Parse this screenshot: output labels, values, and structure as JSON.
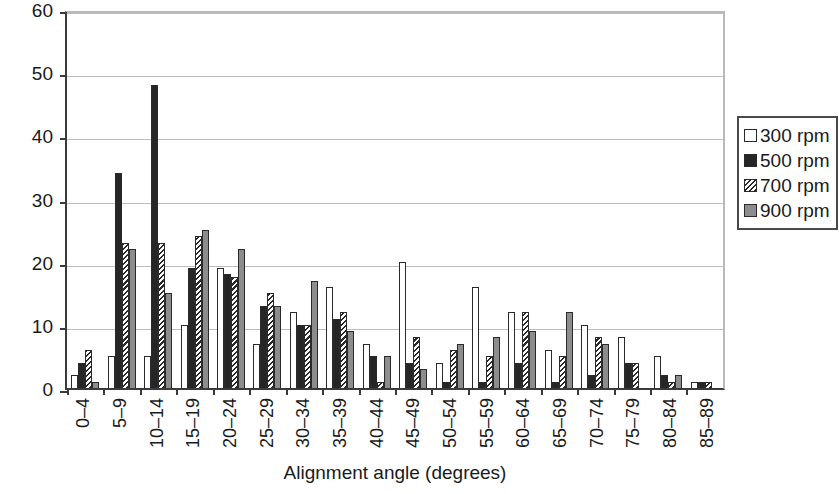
{
  "chart_data": {
    "type": "bar",
    "title": "",
    "xlabel": "Alignment angle (degrees)",
    "ylabel": "Number of fibres",
    "ylim": [
      0,
      60
    ],
    "yticks": [
      0,
      10,
      20,
      30,
      40,
      50,
      60
    ],
    "grid": true,
    "legend_position": "right",
    "categories": [
      "0–4",
      "5–9",
      "10–14",
      "15–19",
      "20–24",
      "25–29",
      "30–34",
      "35–39",
      "40–44",
      "45–49",
      "50–54",
      "55–59",
      "60–64",
      "65–69",
      "70–74",
      "75–79",
      "80–84",
      "85–89"
    ],
    "series": [
      {
        "name": "300 rpm",
        "color": "#ffffff",
        "fill": "white",
        "values": [
          2,
          5,
          5,
          10,
          19,
          7,
          12,
          16,
          7,
          20,
          4,
          16,
          12,
          6,
          10,
          8,
          5,
          1
        ]
      },
      {
        "name": "500 rpm",
        "color": "#262626",
        "fill": "black",
        "values": [
          4,
          34,
          48,
          19,
          18,
          13,
          10,
          11,
          5,
          4,
          1,
          1,
          4,
          1,
          2,
          4,
          2,
          1
        ]
      },
      {
        "name": "700 rpm",
        "color": "#2b2b2b",
        "fill": "hatched",
        "values": [
          6,
          23,
          23,
          24,
          17.5,
          15,
          10,
          12,
          1,
          8,
          6,
          5,
          12,
          5,
          8,
          4,
          1,
          1
        ]
      },
      {
        "name": "900 rpm",
        "color": "#8d8d8d",
        "fill": "gray",
        "values": [
          1,
          22,
          15,
          25,
          22,
          13,
          17,
          9,
          5,
          3,
          7,
          8,
          9,
          12,
          7,
          0,
          2,
          0
        ]
      }
    ]
  },
  "legend": {
    "items": [
      {
        "label": "300 rpm",
        "swatch": "white-square-icon"
      },
      {
        "label": "500 rpm",
        "swatch": "black-square-icon"
      },
      {
        "label": "700 rpm",
        "swatch": "hatched-square-icon"
      },
      {
        "label": "900 rpm",
        "swatch": "gray-square-icon"
      }
    ]
  }
}
